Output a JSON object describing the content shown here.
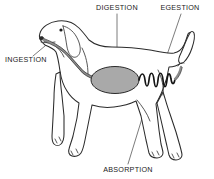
{
  "diagram": {
    "background_color": "#ffffff",
    "outline_color": "#2b2b2b",
    "stomach_color": "#a9a9a9",
    "gut_color": "#8c8c8c",
    "intestine_color": "#141414",
    "label_color": "#1a1a1a",
    "leader_color": "#5a5a5a",
    "labels": [
      {
        "id": "ingestion",
        "text": "INGESTION",
        "x": 5,
        "y": 62,
        "anchor": "start",
        "points_to": "mouth"
      },
      {
        "id": "digestion",
        "text": "DIGESTION",
        "x": 117,
        "y": 10,
        "anchor": "middle",
        "points_to": "stomach"
      },
      {
        "id": "egestion",
        "text": "EGESTION",
        "x": 180,
        "y": 10,
        "anchor": "middle",
        "points_to": "anus"
      },
      {
        "id": "absorption",
        "text": "ABSORPTION",
        "x": 128,
        "y": 172,
        "anchor": "middle",
        "points_to": "intestine"
      }
    ],
    "organs": [
      {
        "id": "esophagus",
        "name": "esophagus"
      },
      {
        "id": "stomach",
        "name": "stomach"
      },
      {
        "id": "small-intestine",
        "name": "coiled small intestine"
      },
      {
        "id": "rectum",
        "name": "rectum"
      }
    ]
  }
}
